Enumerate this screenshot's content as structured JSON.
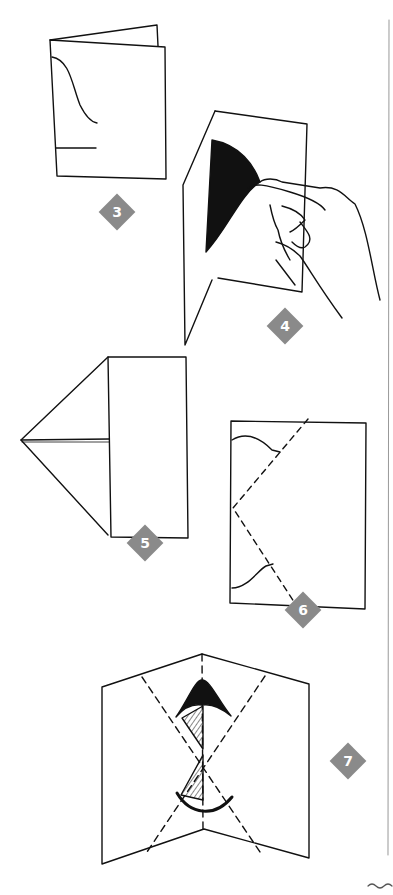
{
  "steps": [
    {
      "id": "step-3",
      "number": "3"
    },
    {
      "id": "step-4",
      "number": "4"
    },
    {
      "id": "step-5",
      "number": "5"
    },
    {
      "id": "step-6",
      "number": "6"
    },
    {
      "id": "step-7",
      "number": "7"
    }
  ],
  "colors": {
    "line": "#111111",
    "badge": "#8a8a8a",
    "badge_text": "#ffffff",
    "divider": "#999999",
    "background": "#ffffff"
  }
}
